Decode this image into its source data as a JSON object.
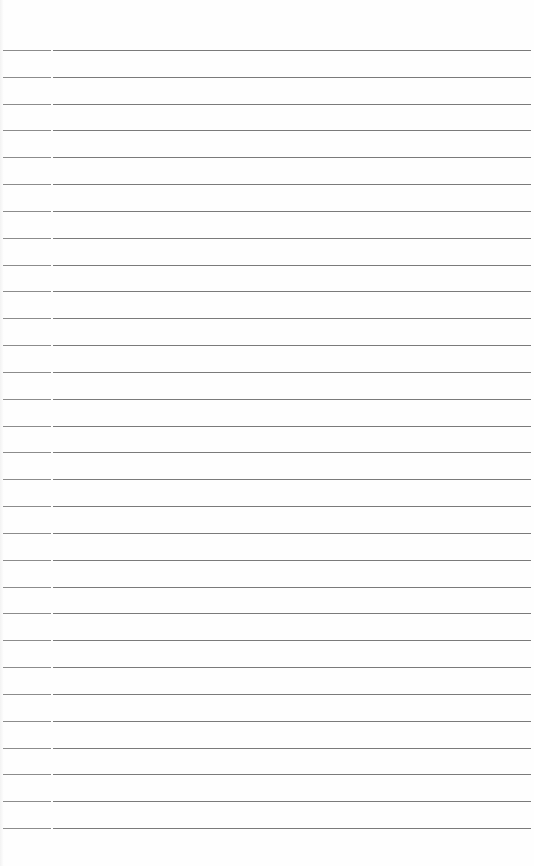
{
  "page": {
    "type": "lined-paper",
    "background": "#ffffff",
    "line_color": "#7a7a7a",
    "line_count": 30,
    "first_line_y": 50,
    "line_spacing": 26.83,
    "line_left": 3,
    "line_right": 531
  }
}
